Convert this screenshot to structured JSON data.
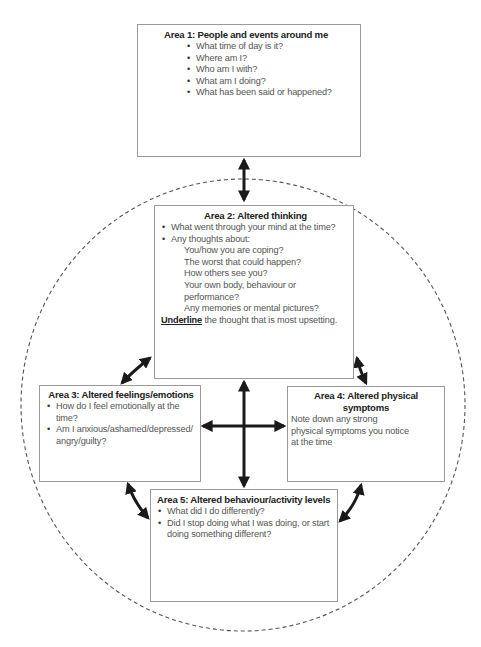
{
  "area1": {
    "title": "Area 1: People and events around me",
    "bullets": [
      "What time of day is it?",
      "Where am I?",
      "Who am I with?",
      "What am I doing?",
      "What has been said or happened?"
    ]
  },
  "area2": {
    "title": "Area 2: Altered thinking",
    "bullets": [
      "What went through your mind at the time?",
      "Any thoughts about:"
    ],
    "sub_items": [
      "You/how you are coping?",
      "The worst that could happen?",
      "How others see you?",
      "Your own body, behaviour or performance?",
      "Any memories or mental pictures?"
    ],
    "instruction_emphasis": "Underline",
    "instruction_rest": " the thought that is most upsetting."
  },
  "area3": {
    "title": "Area 3: Altered feelings/emotions",
    "bullets": [
      "How do I feel emotionally at the time?",
      "Am I anxious/ashamed/depressed/ angry/guilty?"
    ]
  },
  "area4": {
    "title": "Area 4: Altered physical symptoms",
    "note": "Note down any strong physical symptoms you notice at the time"
  },
  "area5": {
    "title": "Area 5: Altered behaviour/activity levels",
    "bullets": [
      "What did I do differently?",
      "Did I stop doing what I was doing, or start doing something different?"
    ]
  },
  "colors": {
    "arrow": "#1a1a1a",
    "border": "#9a9a9a",
    "dash": "#555555"
  }
}
